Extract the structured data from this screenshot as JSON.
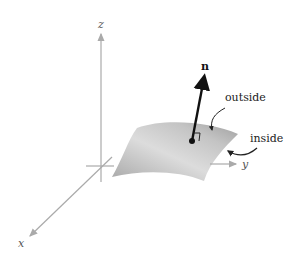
{
  "figure": {
    "axes": {
      "x_label": "x",
      "y_label": "y",
      "z_label": "z"
    },
    "normal_vector_label": "n",
    "annotations": {
      "outside": "outside",
      "inside": "inside"
    },
    "colors": {
      "axis": "#aaaaaa",
      "surface_light": "#e8e8e8",
      "surface_dark": "#9a9a9a",
      "vector": "#111111"
    }
  }
}
